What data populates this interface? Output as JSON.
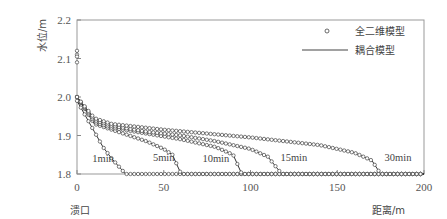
{
  "chart_data": {
    "type": "line",
    "title": "",
    "xlabel": "距离/m",
    "ylabel": "水位/m",
    "x_origin_label": "溃口",
    "xlim": [
      0,
      200
    ],
    "ylim": [
      1.8,
      2.2
    ],
    "xticks": [
      "0",
      "50",
      "100",
      "150",
      "200"
    ],
    "yticks": [
      "1.8",
      "1.9",
      "2.0",
      "2.1",
      "2.2"
    ],
    "grid": false,
    "legend": {
      "position": "upper right",
      "entries": [
        {
          "label": "全二维模型",
          "marker": "circle"
        },
        {
          "label": "耦合模型",
          "marker": "line"
        }
      ]
    },
    "initial_points": {
      "x": [
        0,
        0,
        0,
        0
      ],
      "y": [
        2.12,
        2.11,
        2.105,
        2.09
      ]
    },
    "series": [
      {
        "name": "1min",
        "x": [
          0,
          5,
          10,
          15,
          20,
          25,
          28,
          200
        ],
        "y": [
          1.99,
          1.95,
          1.91,
          1.87,
          1.84,
          1.815,
          1.8,
          1.8
        ]
      },
      {
        "name": "5min",
        "x": [
          0,
          10,
          20,
          30,
          40,
          50,
          55,
          60,
          200
        ],
        "y": [
          2.0,
          1.93,
          1.915,
          1.9,
          1.885,
          1.865,
          1.85,
          1.8,
          1.8
        ]
      },
      {
        "name": "10min",
        "x": [
          0,
          10,
          20,
          40,
          60,
          80,
          90,
          95,
          200
        ],
        "y": [
          2.0,
          1.935,
          1.92,
          1.905,
          1.89,
          1.87,
          1.85,
          1.8,
          1.8
        ]
      },
      {
        "name": "15min",
        "x": [
          0,
          10,
          20,
          40,
          60,
          80,
          100,
          110,
          118,
          200
        ],
        "y": [
          2.0,
          1.94,
          1.925,
          1.91,
          1.9,
          1.885,
          1.865,
          1.845,
          1.8,
          1.8
        ]
      },
      {
        "name": "30min",
        "x": [
          0,
          10,
          20,
          50,
          100,
          140,
          160,
          170,
          175,
          200
        ],
        "y": [
          2.0,
          1.945,
          1.93,
          1.915,
          1.895,
          1.875,
          1.855,
          1.835,
          1.8,
          1.8
        ]
      }
    ],
    "annotations": [
      {
        "text": "1min",
        "x": 15,
        "y": 1.83
      },
      {
        "text": "5min",
        "x": 50,
        "y": 1.835
      },
      {
        "text": "10min",
        "x": 80,
        "y": 1.83
      },
      {
        "text": "15min",
        "x": 125,
        "y": 1.835
      },
      {
        "text": "30min",
        "x": 185,
        "y": 1.835
      }
    ]
  }
}
